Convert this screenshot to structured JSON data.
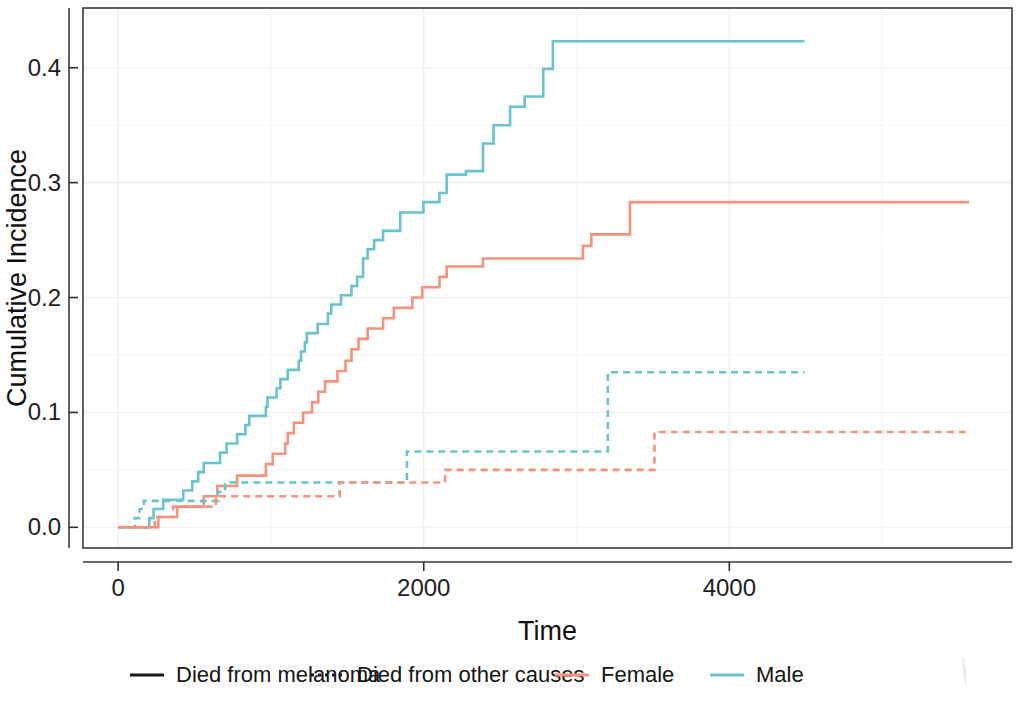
{
  "chart_data": {
    "type": "line",
    "title": "",
    "subtitle": "",
    "xlabel": "Time",
    "ylabel": "Cumulative Incidence",
    "xlim": [
      -230,
      5850
    ],
    "ylim": [
      -0.018,
      0.452
    ],
    "xticks": [
      0,
      2000,
      4000
    ],
    "xticklabels": [
      "0",
      "2000",
      "4000"
    ],
    "yticks": [
      0.0,
      0.1,
      0.2,
      0.3,
      0.4
    ],
    "yticklabels": [
      "0.0",
      "0.1",
      "0.2",
      "0.3",
      "0.4"
    ],
    "xminor": [
      1000,
      3000,
      5000
    ],
    "yminor": [
      0.05,
      0.15,
      0.25,
      0.35
    ],
    "grid": true,
    "legend_position": "bottom",
    "step_type": "hv",
    "colors": {
      "female": "#f4927b",
      "male": "#68c3cd",
      "panel_border": "#3a3a3a",
      "grid_major": "#ececed",
      "text": "#1a1a1a"
    },
    "series": [
      {
        "name": "Male - Died from melanoma",
        "sex": "Male",
        "cause": "Died from melanoma",
        "color": "#68c3cd",
        "dash": false,
        "x": [
          0,
          185,
          204,
          210,
          232,
          279,
          295,
          386,
          426,
          469,
          485,
          492,
          524,
          560,
          667,
          710,
          779,
          833,
          858,
          967,
          977,
          1037,
          1062,
          1110,
          1182,
          1197,
          1222,
          1235,
          1269,
          1291,
          1306,
          1373,
          1395,
          1458,
          1527,
          1564,
          1603,
          1633,
          1675,
          1734,
          1846,
          1998,
          2103,
          2150,
          2276,
          2333,
          2388,
          2457,
          2491,
          2565,
          2661,
          2713,
          2782,
          2845,
          4492
        ],
        "y": [
          0.0,
          0.0,
          0.008,
          0.008,
          0.016,
          0.016,
          0.024,
          0.024,
          0.032,
          0.032,
          0.04,
          0.04,
          0.048,
          0.056,
          0.065,
          0.073,
          0.081,
          0.089,
          0.097,
          0.105,
          0.113,
          0.121,
          0.129,
          0.137,
          0.145,
          0.153,
          0.161,
          0.169,
          0.169,
          0.169,
          0.177,
          0.186,
          0.194,
          0.202,
          0.21,
          0.218,
          0.234,
          0.242,
          0.25,
          0.258,
          0.274,
          0.283,
          0.291,
          0.307,
          0.31,
          0.31,
          0.334,
          0.35,
          0.35,
          0.366,
          0.375,
          0.375,
          0.399,
          0.423,
          0.423
        ]
      },
      {
        "name": "Female - Died from melanoma",
        "sex": "Female",
        "cause": "Died from melanoma",
        "color": "#f4927b",
        "dash": false,
        "x": [
          0,
          251,
          263,
          327,
          351,
          386,
          455,
          500,
          560,
          628,
          649,
          693,
          766,
          779,
          833,
          858,
          890,
          950,
          967,
          1012,
          1093,
          1110,
          1150,
          1211,
          1269,
          1310,
          1354,
          1395,
          1435,
          1488,
          1527,
          1573,
          1633,
          1675,
          1694,
          1734,
          1804,
          1865,
          1925,
          1990,
          2059,
          2103,
          2150,
          2250,
          2318,
          2388,
          2450,
          2559,
          2661,
          2782,
          2845,
          2925,
          3042,
          3097,
          3189,
          3287,
          3350,
          5570
        ],
        "y": [
          0.0,
          0.0,
          0.009,
          0.009,
          0.009,
          0.018,
          0.018,
          0.018,
          0.027,
          0.027,
          0.036,
          0.036,
          0.036,
          0.045,
          0.045,
          0.045,
          0.045,
          0.045,
          0.055,
          0.064,
          0.073,
          0.082,
          0.091,
          0.1,
          0.109,
          0.118,
          0.127,
          0.127,
          0.136,
          0.145,
          0.155,
          0.164,
          0.173,
          0.173,
          0.173,
          0.182,
          0.191,
          0.191,
          0.2,
          0.209,
          0.209,
          0.218,
          0.227,
          0.227,
          0.227,
          0.234,
          0.234,
          0.234,
          0.234,
          0.234,
          0.234,
          0.234,
          0.245,
          0.255,
          0.255,
          0.255,
          0.283,
          0.283
        ]
      },
      {
        "name": "Male - Died from other causes",
        "sex": "Male",
        "cause": "Died from other causes",
        "color": "#68c3cd",
        "dash": true,
        "x": [
          0,
          95,
          108,
          140,
          168,
          620,
          655,
          700,
          1450,
          1505,
          1560,
          1610,
          1850,
          1890,
          3160,
          3205,
          4492
        ],
        "y": [
          0.0,
          0.0,
          0.008,
          0.016,
          0.023,
          0.023,
          0.031,
          0.039,
          0.039,
          0.039,
          0.039,
          0.039,
          0.039,
          0.066,
          0.066,
          0.135,
          0.135
        ]
      },
      {
        "name": "Female - Died from other causes",
        "sex": "Female",
        "cause": "Died from other causes",
        "color": "#f4927b",
        "dash": true,
        "x": [
          0,
          210,
          240,
          300,
          360,
          560,
          640,
          700,
          1390,
          1450,
          2080,
          2140,
          3450,
          3510,
          5570
        ],
        "y": [
          0.0,
          0.0,
          0.009,
          0.009,
          0.018,
          0.018,
          0.027,
          0.027,
          0.027,
          0.039,
          0.039,
          0.05,
          0.05,
          0.083,
          0.083
        ]
      }
    ],
    "legend": {
      "entries": [
        {
          "label": "Died from melanoma",
          "key": "solid-black-line",
          "color": "#1a1a1a",
          "dash": false
        },
        {
          "label": "Died from other causes",
          "key": "dotted-black-line",
          "color": "#1a1a1a",
          "dash": true
        },
        {
          "label": "Female",
          "key": "solid-salmon-line",
          "color": "#f4927b",
          "dash": false
        },
        {
          "label": "Male",
          "key": "solid-teal-line",
          "color": "#68c3cd",
          "dash": false
        }
      ]
    }
  }
}
